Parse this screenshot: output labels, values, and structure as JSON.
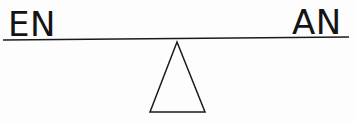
{
  "diagram": {
    "type": "balance-scale",
    "title": "",
    "background_color": "#fdfdfd",
    "ink_color": "#1a1a1a",
    "beam": {
      "name": "balance-beam",
      "x1": 3,
      "y1": 40,
      "x2": 349,
      "y2": 37,
      "stroke_width": 1.6,
      "tilt": "near-level"
    },
    "fulcrum": {
      "name": "triangle-fulcrum",
      "apex_x": 177,
      "apex_y": 42,
      "base_left_x": 150,
      "base_right_x": 205,
      "base_y": 112,
      "filled": false,
      "stroke_width": 1.5
    },
    "labels": [
      {
        "id": "left-label",
        "text": "EN",
        "side": "left",
        "x": 8,
        "y": 36,
        "font_size": 34
      },
      {
        "id": "right-label",
        "text": "AN",
        "side": "right",
        "x": 292,
        "y": 34,
        "font_size": 34
      }
    ]
  }
}
